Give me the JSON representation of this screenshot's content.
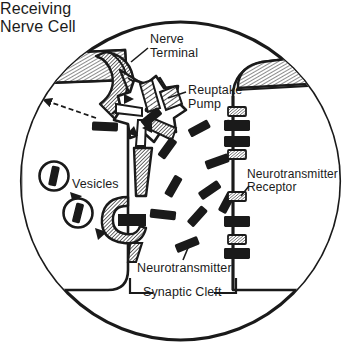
{
  "figure": {
    "kind": "synapse-diagram",
    "frame": "circle",
    "ink_color": "#1a1a1a",
    "paper_color": "#ffffff"
  },
  "labels": {
    "nerve_terminal": "Nerve\nTerminal",
    "reuptake_pump": "Reuptake\nPump",
    "receiving_nerve_cell": "Receiving\nNerve Cell",
    "neurotransmitter_receptor": "Neurotransmitter\nReceptor",
    "vesicles": "Vesicles",
    "neurotransmitter": "Neurotransmitter",
    "synaptic_cleft": "Synaptic Cleft"
  },
  "structures": {
    "presynaptic_cell": "presynaptic-nerve-terminal",
    "postsynaptic_cell": "receiving-nerve-cell",
    "cleft": "synaptic-cleft",
    "pump": "reuptake-pump",
    "vesicle_count": 2,
    "fusing_vesicle": 1,
    "receptor_count": 8,
    "receptors_occupied": 4,
    "receptors_empty": 4,
    "neurotransmitter_particles": 12
  },
  "neurotransmitters": [
    {
      "x": 196,
      "y": 131,
      "angle": -28
    },
    {
      "x": 215,
      "y": 162,
      "angle": -22
    },
    {
      "x": 165,
      "y": 152,
      "angle": -52
    },
    {
      "x": 172,
      "y": 190,
      "angle": -58
    },
    {
      "x": 208,
      "y": 192,
      "angle": -34
    },
    {
      "x": 163,
      "y": 216,
      "angle": 8
    },
    {
      "x": 196,
      "y": 218,
      "angle": -46
    },
    {
      "x": 185,
      "y": 246,
      "angle": -20
    },
    {
      "x": 236,
      "y": 126,
      "angle": 10
    },
    {
      "x": 149,
      "y": 120,
      "angle": -40
    },
    {
      "x": 103,
      "y": 128,
      "angle": 2
    },
    {
      "x": 226,
      "y": 205,
      "angle": -62
    }
  ],
  "receptors": [
    {
      "y": 112,
      "state": "empty"
    },
    {
      "y": 126,
      "state": "occupied"
    },
    {
      "y": 140,
      "state": "occupied"
    },
    {
      "y": 154,
      "state": "empty"
    },
    {
      "y": 196,
      "state": "empty"
    },
    {
      "y": 222,
      "state": "occupied"
    },
    {
      "y": 240,
      "state": "empty"
    },
    {
      "y": 254,
      "state": "occupied"
    }
  ],
  "vesicles": [
    {
      "cx": 54,
      "cy": 176,
      "r": 14
    },
    {
      "cx": 78,
      "cy": 213,
      "r": 14
    }
  ]
}
